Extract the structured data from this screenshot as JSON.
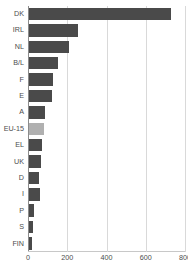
{
  "chart_data": {
    "type": "bar",
    "orientation": "horizontal",
    "title": "",
    "subtitle": "",
    "xlabel": "",
    "ylabel": "",
    "categories": [
      "DK",
      "IRL",
      "NL",
      "B/L",
      "F",
      "E",
      "A",
      "EU-15",
      "EL",
      "UK",
      "D",
      "I",
      "P",
      "S",
      "FIN"
    ],
    "values": [
      724,
      251,
      205,
      149,
      124,
      118,
      83,
      78,
      67,
      63,
      53,
      58,
      28,
      18,
      15
    ],
    "highlight_category": "EU-15",
    "xlim": [
      0,
      800
    ],
    "xticks": [
      0,
      200,
      400,
      600,
      800
    ],
    "xtick_labels": [
      "0",
      "200",
      "400",
      "600",
      "800"
    ],
    "grid": "vertical",
    "legend": "none",
    "bar_color": "#4a4a4a",
    "highlight_color": "#b0b0b0",
    "grid_color": "#d9d9d9",
    "axis_color": "#8c8c8c",
    "text_color": "#4d4d4d",
    "background": "#ffffff"
  }
}
